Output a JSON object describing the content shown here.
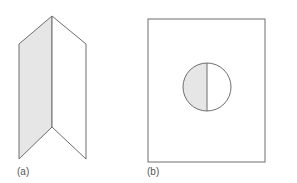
{
  "figure": {
    "panels": [
      {
        "label": "(a)",
        "description": "folded sheet with shaded left panel"
      },
      {
        "label": "(b)",
        "description": "rectangle containing a circle with shaded left half"
      }
    ],
    "colors": {
      "stroke": "#6e6e6e",
      "shade": "#e6e6e6",
      "background": "#ffffff"
    }
  }
}
